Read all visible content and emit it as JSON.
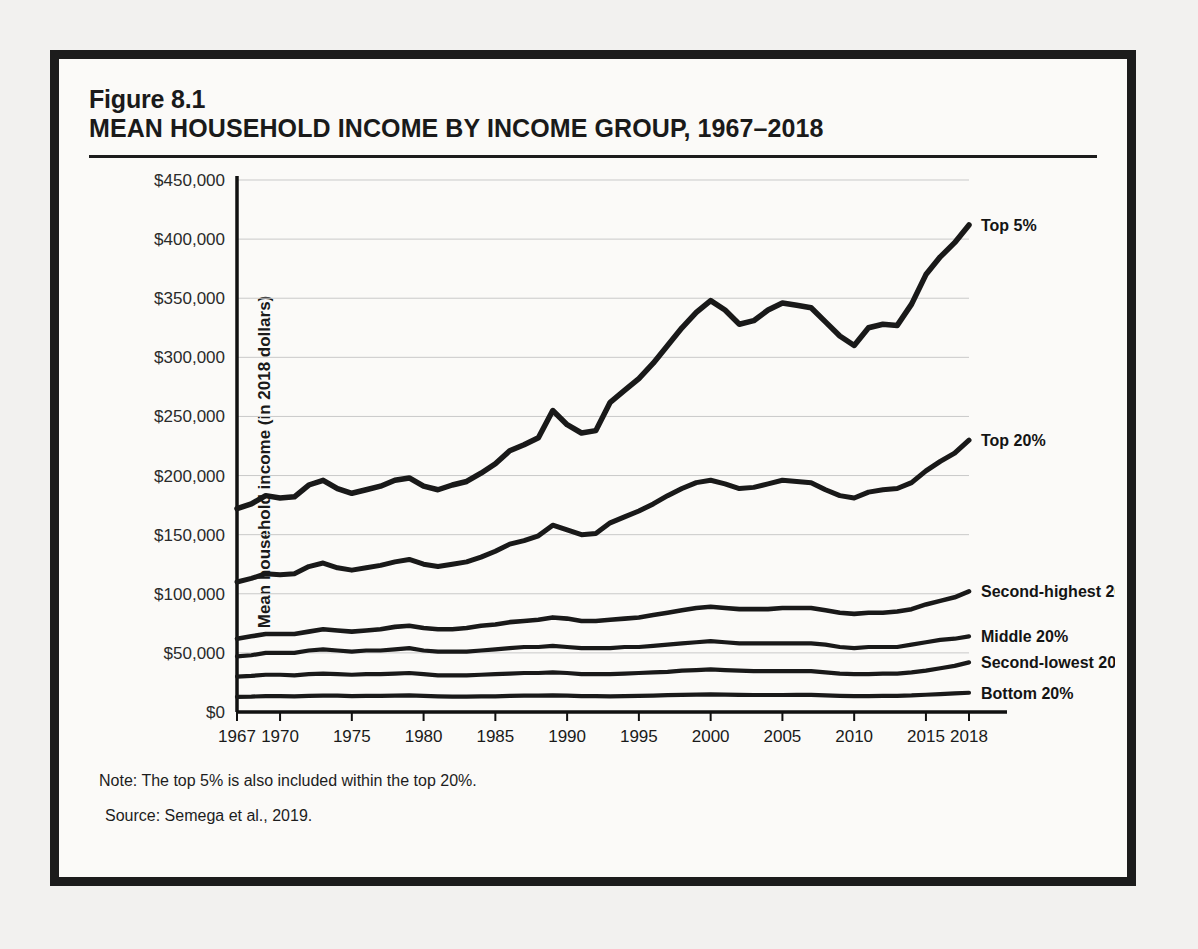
{
  "figure": {
    "number": "Figure 8.1",
    "title": "MEAN HOUSEHOLD INCOME BY INCOME GROUP, 1967–2018",
    "note": "Note: The top 5% is also included within the top 20%.",
    "source": "Source: Semega et al., 2019."
  },
  "colors": {
    "page_background": "#f2f1ef",
    "figure_background": "#fbfaf8",
    "frame": "#1c1c1c",
    "line": "#191919",
    "gridline": "#c9c9c9",
    "text": "#1a1a1a"
  },
  "chart_data": {
    "type": "line",
    "title": "MEAN HOUSEHOLD INCOME BY INCOME GROUP, 1967–2018",
    "xlabel": "",
    "ylabel": "Mean household income (in 2018 dollars)",
    "xlim": [
      1967,
      2018
    ],
    "ylim": [
      0,
      450000
    ],
    "ytick_values": [
      0,
      50000,
      100000,
      150000,
      200000,
      250000,
      300000,
      350000,
      400000,
      450000
    ],
    "ytick_labels": [
      "$0",
      "$50,000",
      "$100,000",
      "$150,000",
      "$200,000",
      "$250,000",
      "$300,000",
      "$350,000",
      "$400,000",
      "$450,000"
    ],
    "xtick_values": [
      1967,
      1970,
      1975,
      1980,
      1985,
      1990,
      1995,
      2000,
      2005,
      2010,
      2015,
      2018
    ],
    "xtick_labels": [
      "1967",
      "1970",
      "1975",
      "1980",
      "1985",
      "1990",
      "1995",
      "2000",
      "2005",
      "2010",
      "2015",
      "2018"
    ],
    "grid": "horizontal",
    "legend_position": "right-inline-labels",
    "x": [
      1967,
      1968,
      1969,
      1970,
      1971,
      1972,
      1973,
      1974,
      1975,
      1976,
      1977,
      1978,
      1979,
      1980,
      1981,
      1982,
      1983,
      1984,
      1985,
      1986,
      1987,
      1988,
      1989,
      1990,
      1991,
      1992,
      1993,
      1994,
      1995,
      1996,
      1997,
      1998,
      1999,
      2000,
      2001,
      2002,
      2003,
      2004,
      2005,
      2006,
      2007,
      2008,
      2009,
      2010,
      2011,
      2012,
      2013,
      2014,
      2015,
      2016,
      2017,
      2018
    ],
    "series": [
      {
        "name": "Top 5%",
        "label": "Top 5%",
        "values": [
          172000,
          176000,
          183000,
          181000,
          182000,
          192000,
          196000,
          189000,
          185000,
          188000,
          191000,
          196000,
          198000,
          191000,
          188000,
          192000,
          195000,
          202000,
          210000,
          221000,
          226000,
          232000,
          255000,
          243000,
          236000,
          238000,
          262000,
          272000,
          282000,
          295000,
          310000,
          325000,
          338000,
          348000,
          340000,
          328000,
          331000,
          340000,
          346000,
          344000,
          342000,
          330000,
          318000,
          310000,
          325000,
          328000,
          327000,
          345000,
          370000,
          385000,
          397000,
          412000
        ]
      },
      {
        "name": "Top 20%",
        "label": "Top 20%",
        "values": [
          110000,
          113000,
          117000,
          116000,
          117000,
          123000,
          126000,
          122000,
          120000,
          122000,
          124000,
          127000,
          129000,
          125000,
          123000,
          125000,
          127000,
          131000,
          136000,
          142000,
          145000,
          149000,
          158000,
          154000,
          150000,
          151000,
          160000,
          165000,
          170000,
          176000,
          183000,
          189000,
          194000,
          196000,
          193000,
          189000,
          190000,
          193000,
          196000,
          195000,
          194000,
          188000,
          183000,
          181000,
          186000,
          188000,
          189000,
          194000,
          204000,
          212000,
          219000,
          230000
        ]
      },
      {
        "name": "Second-highest 20%",
        "label": "Second-highest 20%",
        "values": [
          62000,
          64000,
          66000,
          66000,
          66000,
          68000,
          70000,
          69000,
          68000,
          69000,
          70000,
          72000,
          73000,
          71000,
          70000,
          70000,
          71000,
          73000,
          74000,
          76000,
          77000,
          78000,
          80000,
          79000,
          77000,
          77000,
          78000,
          79000,
          80000,
          82000,
          84000,
          86000,
          88000,
          89000,
          88000,
          87000,
          87000,
          87000,
          88000,
          88000,
          88000,
          86000,
          84000,
          83000,
          84000,
          84000,
          85000,
          87000,
          91000,
          94000,
          97000,
          102000
        ]
      },
      {
        "name": "Middle 20%",
        "label": "Middle 20%",
        "values": [
          47000,
          48000,
          50000,
          50000,
          50000,
          52000,
          53000,
          52000,
          51000,
          52000,
          52000,
          53000,
          54000,
          52000,
          51000,
          51000,
          51000,
          52000,
          53000,
          54000,
          55000,
          55000,
          56000,
          55000,
          54000,
          54000,
          54000,
          55000,
          55000,
          56000,
          57000,
          58000,
          59000,
          60000,
          59000,
          58000,
          58000,
          58000,
          58000,
          58000,
          58000,
          57000,
          55000,
          54000,
          55000,
          55000,
          55000,
          57000,
          59000,
          61000,
          62000,
          64000
        ]
      },
      {
        "name": "Second-lowest 20%",
        "label": "Second-lowest 20%",
        "values": [
          30000,
          30500,
          31500,
          31500,
          31000,
          32000,
          32500,
          32000,
          31500,
          32000,
          32000,
          32500,
          33000,
          32000,
          31000,
          31000,
          31000,
          31500,
          32000,
          32500,
          33000,
          33000,
          33500,
          33000,
          32000,
          32000,
          32000,
          32500,
          33000,
          33500,
          34000,
          35000,
          35500,
          36000,
          35500,
          35000,
          34500,
          34500,
          34500,
          34500,
          34500,
          33500,
          32500,
          32000,
          32000,
          32500,
          32500,
          33500,
          35000,
          37000,
          39000,
          42000
        ]
      },
      {
        "name": "Bottom 20%",
        "label": "Bottom 20%",
        "values": [
          12800,
          13000,
          13500,
          13500,
          13300,
          13600,
          13900,
          13800,
          13500,
          13700,
          13700,
          13900,
          14000,
          13600,
          13200,
          13000,
          13000,
          13200,
          13300,
          13600,
          13800,
          13900,
          14100,
          13900,
          13500,
          13400,
          13300,
          13500,
          13700,
          13900,
          14200,
          14500,
          14700,
          14900,
          14700,
          14500,
          14400,
          14400,
          14400,
          14500,
          14500,
          14100,
          13700,
          13500,
          13500,
          13600,
          13700,
          14000,
          14600,
          15200,
          15700,
          16300
        ]
      }
    ],
    "series_label_anchor_year": 2018,
    "line_weights": [
      5.5,
      5.0,
      4.6,
      4.2,
      4.2,
      4.2
    ]
  },
  "bleed_text": {
    "right_column": [
      "The ratio of CEO to worker compensation rose from its lowest point in",
      "1965, when the ratio was 20 to 1, to its highest point in 2000, when the",
      "ratio reached 376 to 1. The ratio has declined since then but has remained",
      "above 200 to 1. Today, the compensation of the average CEO is more than",
      "200 times that of a typical worker."
    ]
  }
}
